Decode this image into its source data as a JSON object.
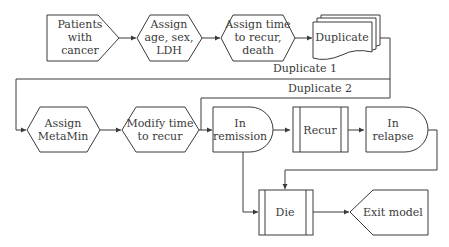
{
  "diagram": {
    "type": "flowchart",
    "nodes": {
      "patients": {
        "shape": "pentagon-right",
        "lines": [
          "Patients",
          "with",
          "cancer"
        ]
      },
      "assign_age": {
        "shape": "hexagon",
        "lines": [
          "Assign",
          "age, sex,",
          "LDH"
        ]
      },
      "assign_time": {
        "shape": "hexagon",
        "lines": [
          "Assign time",
          "to recur,",
          "death"
        ]
      },
      "duplicate": {
        "shape": "multi-document",
        "lines": [
          "Duplicate"
        ]
      },
      "assign_metamin": {
        "shape": "hexagon",
        "lines": [
          "Assign",
          "MetaMin"
        ]
      },
      "modify_time": {
        "shape": "hexagon",
        "lines": [
          "Modify time",
          "to recur"
        ]
      },
      "in_remission": {
        "shape": "delay",
        "lines": [
          "In",
          "remission"
        ]
      },
      "recur": {
        "shape": "predefined-process",
        "lines": [
          "Recur"
        ]
      },
      "in_relapse": {
        "shape": "delay",
        "lines": [
          "In",
          "relapse"
        ]
      },
      "die": {
        "shape": "predefined-process",
        "lines": [
          "Die"
        ]
      },
      "exit_model": {
        "shape": "display",
        "lines": [
          "Exit model"
        ]
      }
    },
    "edge_labels": {
      "duplicate_1": "Duplicate 1",
      "duplicate_2": "Duplicate 2"
    },
    "edges": [
      {
        "from": "patients",
        "to": "assign_age"
      },
      {
        "from": "assign_age",
        "to": "assign_time"
      },
      {
        "from": "assign_time",
        "to": "duplicate"
      },
      {
        "from": "duplicate",
        "to": "assign_metamin",
        "label": "Duplicate 1"
      },
      {
        "from": "duplicate",
        "to": "in_remission",
        "label": "Duplicate 2"
      },
      {
        "from": "assign_metamin",
        "to": "modify_time"
      },
      {
        "from": "modify_time",
        "to": "in_remission"
      },
      {
        "from": "in_remission",
        "to": "recur"
      },
      {
        "from": "recur",
        "to": "in_relapse"
      },
      {
        "from": "in_remission",
        "to": "die"
      },
      {
        "from": "in_relapse",
        "to": "die"
      },
      {
        "from": "die",
        "to": "exit_model"
      }
    ],
    "colors": {
      "stroke": "#3a3a3a",
      "fill": "#ffffff",
      "text": "#3a3a3a"
    }
  }
}
